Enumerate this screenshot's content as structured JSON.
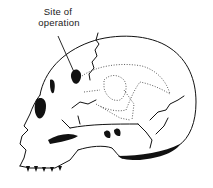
{
  "figure": {
    "annotation": {
      "line1": "Site of",
      "line2": "operation"
    },
    "colors": {
      "ink": "#111111",
      "background": "#ffffff"
    }
  }
}
